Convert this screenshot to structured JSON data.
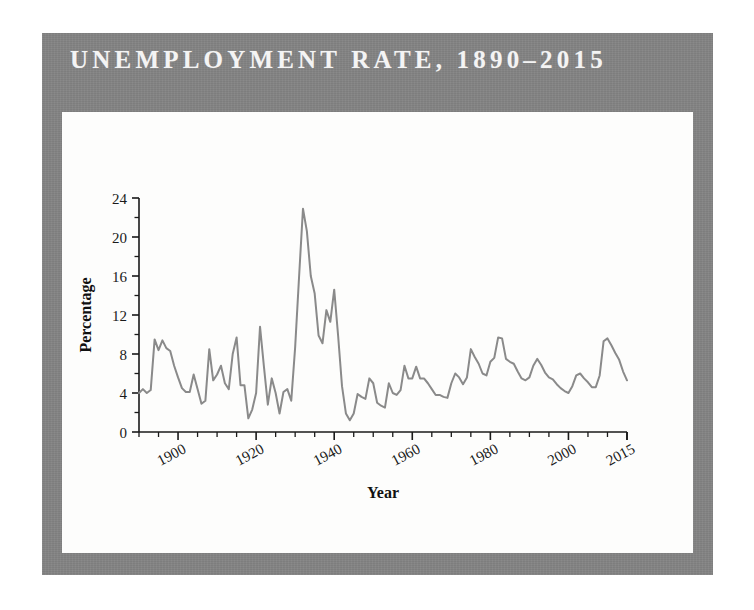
{
  "figure": {
    "title": "UNEMPLOYMENT RATE, 1890–2015",
    "frame_color": "#828282",
    "panel_color": "#fdfdfc",
    "line_color": "#8a8a8a",
    "text_color": "#1a1a1a",
    "title_color": "#f4f4f4"
  },
  "chart_data": {
    "type": "line",
    "title": "UNEMPLOYMENT RATE, 1890–2015",
    "xlabel": "Year",
    "ylabel": "Percentage",
    "xlim": [
      1890,
      2015
    ],
    "ylim": [
      0,
      24
    ],
    "grid": false,
    "legend": "none",
    "x_major_ticks": [
      1900,
      1920,
      1940,
      1960,
      1980,
      2000,
      2015
    ],
    "x_major_tick_labels": [
      "1900",
      "1920",
      "1940",
      "1960",
      "1980",
      "2000",
      "2015"
    ],
    "x_minor_tick_step": 5,
    "y_major_ticks": [
      0,
      4,
      8,
      12,
      16,
      20,
      24
    ],
    "y_major_tick_labels": [
      "0",
      "4",
      "8",
      "12",
      "16",
      "20",
      "24"
    ],
    "y_minor_ticks": [
      2,
      6,
      10,
      14,
      18,
      22
    ],
    "series": [
      {
        "name": "Unemployment rate",
        "color": "#8a8a8a",
        "x": [
          1890,
          1891,
          1892,
          1893,
          1894,
          1895,
          1896,
          1897,
          1898,
          1899,
          1900,
          1901,
          1902,
          1903,
          1904,
          1905,
          1906,
          1907,
          1908,
          1909,
          1910,
          1911,
          1912,
          1913,
          1914,
          1915,
          1916,
          1917,
          1918,
          1919,
          1920,
          1921,
          1922,
          1923,
          1924,
          1925,
          1926,
          1927,
          1928,
          1929,
          1930,
          1931,
          1932,
          1933,
          1934,
          1935,
          1936,
          1937,
          1938,
          1939,
          1940,
          1941,
          1942,
          1943,
          1944,
          1945,
          1946,
          1947,
          1948,
          1949,
          1950,
          1951,
          1952,
          1953,
          1954,
          1955,
          1956,
          1957,
          1958,
          1959,
          1960,
          1961,
          1962,
          1963,
          1964,
          1965,
          1966,
          1967,
          1968,
          1969,
          1970,
          1971,
          1972,
          1973,
          1974,
          1975,
          1976,
          1977,
          1978,
          1979,
          1980,
          1981,
          1982,
          1983,
          1984,
          1985,
          1986,
          1987,
          1988,
          1989,
          1990,
          1991,
          1992,
          1993,
          1994,
          1995,
          1996,
          1997,
          1998,
          1999,
          2000,
          2001,
          2002,
          2003,
          2004,
          2005,
          2006,
          2007,
          2008,
          2009,
          2010,
          2011,
          2012,
          2013,
          2014,
          2015
        ],
        "values": [
          4.0,
          4.4,
          4.0,
          4.3,
          9.5,
          8.4,
          9.4,
          8.6,
          8.3,
          6.8,
          5.6,
          4.5,
          4.1,
          4.1,
          5.9,
          4.4,
          2.9,
          3.2,
          8.5,
          5.3,
          5.9,
          6.8,
          5.0,
          4.4,
          8.0,
          9.7,
          4.8,
          4.8,
          1.4,
          2.3,
          4.0,
          10.8,
          6.7,
          2.8,
          5.5,
          4.0,
          1.9,
          4.1,
          4.4,
          3.2,
          8.7,
          15.9,
          22.9,
          20.6,
          16.0,
          14.2,
          9.9,
          9.1,
          12.5,
          11.3,
          14.6,
          9.9,
          4.7,
          1.9,
          1.2,
          1.9,
          3.9,
          3.6,
          3.4,
          5.5,
          5.0,
          3.0,
          2.7,
          2.5,
          5.0,
          4.0,
          3.8,
          4.3,
          6.8,
          5.5,
          5.5,
          6.7,
          5.5,
          5.5,
          5.0,
          4.4,
          3.8,
          3.8,
          3.6,
          3.5,
          5.0,
          6.0,
          5.6,
          4.9,
          5.6,
          8.5,
          7.7,
          7.0,
          6.0,
          5.8,
          7.2,
          7.6,
          9.7,
          9.6,
          7.5,
          7.2,
          7.0,
          6.2,
          5.5,
          5.3,
          5.6,
          6.8,
          7.5,
          6.9,
          6.1,
          5.6,
          5.4,
          4.9,
          4.5,
          4.2,
          4.0,
          4.7,
          5.8,
          6.0,
          5.5,
          5.1,
          4.6,
          4.6,
          5.8,
          9.3,
          9.6,
          8.9,
          8.1,
          7.4,
          6.2,
          5.3
        ]
      }
    ]
  }
}
